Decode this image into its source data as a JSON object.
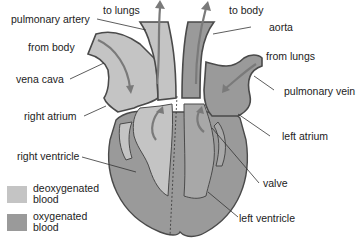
{
  "colors": {
    "deoxygenated": "#c4c4c4",
    "oxygenated": "#9a9a9a",
    "outline": "#4a4a4a",
    "arrow": "#7a7a7a",
    "background": "#ffffff"
  },
  "labels": {
    "pulmonary_artery": "pulmonary artery",
    "to_lungs": "to lungs",
    "to_body": "to body",
    "aorta": "aorta",
    "from_body": "from body",
    "from_lungs": "from lungs",
    "vena_cava": "vena cava",
    "pulmonary_vein": "pulmonary vein",
    "right_atrium": "right atrium",
    "left_atrium": "left atrium",
    "right_ventricle": "right ventricle",
    "valve": "valve",
    "left_ventricle": "left ventricle"
  },
  "legend": [
    {
      "label_line1": "deoxygenated",
      "label_line2": "blood",
      "color": "#c4c4c4"
    },
    {
      "label_line1": "oxygenated",
      "label_line2": "blood",
      "color": "#9a9a9a"
    }
  ]
}
